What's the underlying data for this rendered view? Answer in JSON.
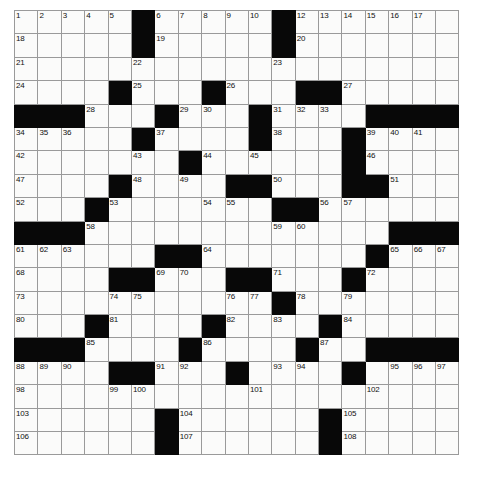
{
  "puzzle": {
    "kind": "crossword-grid",
    "rows": 19,
    "cols": 19,
    "cell_size_px": 23.4,
    "colors": {
      "block": "#080808",
      "open": "#fbfbfa",
      "grid_line": "#9a9a9a",
      "number_text": "#111111",
      "page_background": "#ffffff"
    },
    "counts": {
      "total_cells": 361,
      "block_cells": 81,
      "open_cells": 280,
      "highest_clue_number": 108
    },
    "blocks": [
      [
        0,
        5
      ],
      [
        0,
        11
      ],
      [
        1,
        5
      ],
      [
        1,
        11
      ],
      [
        3,
        4
      ],
      [
        3,
        8
      ],
      [
        3,
        12
      ],
      [
        3,
        13
      ],
      [
        4,
        0
      ],
      [
        4,
        1
      ],
      [
        4,
        2
      ],
      [
        4,
        6
      ],
      [
        4,
        10
      ],
      [
        4,
        15
      ],
      [
        4,
        16
      ],
      [
        4,
        17
      ],
      [
        4,
        18
      ],
      [
        5,
        5
      ],
      [
        5,
        10
      ],
      [
        5,
        14
      ],
      [
        6,
        7
      ],
      [
        6,
        14
      ],
      [
        7,
        4
      ],
      [
        7,
        9
      ],
      [
        7,
        10
      ],
      [
        7,
        14
      ],
      [
        7,
        15
      ],
      [
        8,
        3
      ],
      [
        8,
        11
      ],
      [
        8,
        12
      ],
      [
        9,
        0
      ],
      [
        9,
        1
      ],
      [
        9,
        2
      ],
      [
        9,
        16
      ],
      [
        9,
        17
      ],
      [
        9,
        18
      ],
      [
        10,
        6
      ],
      [
        10,
        7
      ],
      [
        10,
        15
      ],
      [
        11,
        4
      ],
      [
        11,
        5
      ],
      [
        11,
        9
      ],
      [
        11,
        10
      ],
      [
        11,
        14
      ],
      [
        12,
        11
      ],
      [
        13,
        3
      ],
      [
        13,
        8
      ],
      [
        13,
        13
      ],
      [
        14,
        0
      ],
      [
        14,
        1
      ],
      [
        14,
        2
      ],
      [
        14,
        7
      ],
      [
        14,
        12
      ],
      [
        14,
        15
      ],
      [
        14,
        16
      ],
      [
        14,
        17
      ],
      [
        14,
        18
      ],
      [
        15,
        4
      ],
      [
        15,
        5
      ],
      [
        15,
        9
      ],
      [
        15,
        14
      ],
      [
        17,
        6
      ],
      [
        17,
        13
      ],
      [
        18,
        6
      ],
      [
        18,
        13
      ]
    ],
    "numbers": [
      {
        "n": 1,
        "r": 0,
        "c": 0
      },
      {
        "n": 2,
        "r": 0,
        "c": 1
      },
      {
        "n": 3,
        "r": 0,
        "c": 2
      },
      {
        "n": 4,
        "r": 0,
        "c": 3
      },
      {
        "n": 5,
        "r": 0,
        "c": 4
      },
      {
        "n": 6,
        "r": 0,
        "c": 6
      },
      {
        "n": 7,
        "r": 0,
        "c": 7
      },
      {
        "n": 8,
        "r": 0,
        "c": 8
      },
      {
        "n": 9,
        "r": 0,
        "c": 9
      },
      {
        "n": 10,
        "r": 0,
        "c": 10
      },
      {
        "n": 11,
        "r": 0,
        "c": 11
      },
      {
        "n": 12,
        "r": 0,
        "c": 12
      },
      {
        "n": 13,
        "r": 0,
        "c": 13
      },
      {
        "n": 14,
        "r": 0,
        "c": 14
      },
      {
        "n": 15,
        "r": 0,
        "c": 15
      },
      {
        "n": 16,
        "r": 0,
        "c": 16
      },
      {
        "n": 17,
        "r": 0,
        "c": 17
      },
      {
        "n": 18,
        "r": 1,
        "c": 0
      },
      {
        "n": 19,
        "r": 1,
        "c": 6
      },
      {
        "n": 20,
        "r": 1,
        "c": 12
      },
      {
        "n": 21,
        "r": 2,
        "c": 0
      },
      {
        "n": 22,
        "r": 2,
        "c": 5
      },
      {
        "n": 23,
        "r": 2,
        "c": 11
      },
      {
        "n": 24,
        "r": 3,
        "c": 0
      },
      {
        "n": 25,
        "r": 3,
        "c": 5
      },
      {
        "n": 26,
        "r": 3,
        "c": 9
      },
      {
        "n": 27,
        "r": 3,
        "c": 14
      },
      {
        "n": 28,
        "r": 4,
        "c": 3
      },
      {
        "n": 29,
        "r": 4,
        "c": 7
      },
      {
        "n": 30,
        "r": 4,
        "c": 8
      },
      {
        "n": 31,
        "r": 4,
        "c": 11
      },
      {
        "n": 32,
        "r": 4,
        "c": 12
      },
      {
        "n": 33,
        "r": 4,
        "c": 13
      },
      {
        "n": 34,
        "r": 5,
        "c": 0
      },
      {
        "n": 35,
        "r": 5,
        "c": 1
      },
      {
        "n": 36,
        "r": 5,
        "c": 2
      },
      {
        "n": 37,
        "r": 5,
        "c": 6
      },
      {
        "n": 38,
        "r": 5,
        "c": 11
      },
      {
        "n": 39,
        "r": 5,
        "c": 15
      },
      {
        "n": 40,
        "r": 5,
        "c": 16
      },
      {
        "n": 41,
        "r": 5,
        "c": 17
      },
      {
        "n": 42,
        "r": 6,
        "c": 0
      },
      {
        "n": 43,
        "r": 6,
        "c": 5
      },
      {
        "n": 44,
        "r": 6,
        "c": 8
      },
      {
        "n": 45,
        "r": 6,
        "c": 10
      },
      {
        "n": 46,
        "r": 6,
        "c": 15
      },
      {
        "n": 47,
        "r": 7,
        "c": 0
      },
      {
        "n": 48,
        "r": 7,
        "c": 5
      },
      {
        "n": 49,
        "r": 7,
        "c": 7
      },
      {
        "n": 50,
        "r": 7,
        "c": 11
      },
      {
        "n": 51,
        "r": 7,
        "c": 16
      },
      {
        "n": 52,
        "r": 8,
        "c": 0
      },
      {
        "n": 53,
        "r": 8,
        "c": 4
      },
      {
        "n": 54,
        "r": 8,
        "c": 8
      },
      {
        "n": 55,
        "r": 8,
        "c": 9
      },
      {
        "n": 56,
        "r": 8,
        "c": 13
      },
      {
        "n": 57,
        "r": 8,
        "c": 14
      },
      {
        "n": 58,
        "r": 9,
        "c": 3
      },
      {
        "n": 59,
        "r": 9,
        "c": 11
      },
      {
        "n": 60,
        "r": 9,
        "c": 12
      },
      {
        "n": 61,
        "r": 10,
        "c": 0
      },
      {
        "n": 62,
        "r": 10,
        "c": 1
      },
      {
        "n": 63,
        "r": 10,
        "c": 2
      },
      {
        "n": 64,
        "r": 10,
        "c": 8
      },
      {
        "n": 65,
        "r": 10,
        "c": 16
      },
      {
        "n": 66,
        "r": 10,
        "c": 17
      },
      {
        "n": 67,
        "r": 10,
        "c": 18
      },
      {
        "n": 68,
        "r": 11,
        "c": 0
      },
      {
        "n": 69,
        "r": 11,
        "c": 6
      },
      {
        "n": 70,
        "r": 11,
        "c": 7
      },
      {
        "n": 71,
        "r": 11,
        "c": 11
      },
      {
        "n": 72,
        "r": 11,
        "c": 15
      },
      {
        "n": 73,
        "r": 12,
        "c": 0
      },
      {
        "n": 74,
        "r": 12,
        "c": 4
      },
      {
        "n": 75,
        "r": 12,
        "c": 5
      },
      {
        "n": 76,
        "r": 12,
        "c": 9
      },
      {
        "n": 77,
        "r": 12,
        "c": 10
      },
      {
        "n": 78,
        "r": 12,
        "c": 12
      },
      {
        "n": 79,
        "r": 12,
        "c": 14
      },
      {
        "n": 80,
        "r": 13,
        "c": 0
      },
      {
        "n": 81,
        "r": 13,
        "c": 4
      },
      {
        "n": 82,
        "r": 13,
        "c": 9
      },
      {
        "n": 83,
        "r": 13,
        "c": 11
      },
      {
        "n": 84,
        "r": 13,
        "c": 14
      },
      {
        "n": 85,
        "r": 14,
        "c": 3
      },
      {
        "n": 86,
        "r": 14,
        "c": 8
      },
      {
        "n": 87,
        "r": 14,
        "c": 13
      },
      {
        "n": 88,
        "r": 15,
        "c": 0
      },
      {
        "n": 89,
        "r": 15,
        "c": 1
      },
      {
        "n": 90,
        "r": 15,
        "c": 2
      },
      {
        "n": 91,
        "r": 15,
        "c": 6
      },
      {
        "n": 92,
        "r": 15,
        "c": 7
      },
      {
        "n": 93,
        "r": 15,
        "c": 11
      },
      {
        "n": 94,
        "r": 15,
        "c": 12
      },
      {
        "n": 95,
        "r": 15,
        "c": 16
      },
      {
        "n": 96,
        "r": 15,
        "c": 17
      },
      {
        "n": 97,
        "r": 15,
        "c": 18
      },
      {
        "n": 98,
        "r": 16,
        "c": 0
      },
      {
        "n": 99,
        "r": 16,
        "c": 4
      },
      {
        "n": 100,
        "r": 16,
        "c": 5
      },
      {
        "n": 101,
        "r": 16,
        "c": 10
      },
      {
        "n": 102,
        "r": 16,
        "c": 15
      },
      {
        "n": 103,
        "r": 17,
        "c": 0
      },
      {
        "n": 104,
        "r": 17,
        "c": 7
      },
      {
        "n": 105,
        "r": 17,
        "c": 14
      },
      {
        "n": 106,
        "r": 18,
        "c": 0
      },
      {
        "n": 107,
        "r": 18,
        "c": 7
      },
      {
        "n": 108,
        "r": 18,
        "c": 14
      }
    ]
  }
}
